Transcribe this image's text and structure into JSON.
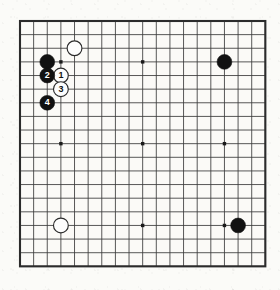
{
  "diagram": {
    "kind": "go-board-diagram",
    "board_size": 19,
    "title": "",
    "caption": "",
    "geometry": {
      "origin_x": 20,
      "origin_y": 21,
      "cell": 13.63,
      "stone_radius": 7.4,
      "line_color": "#3a3a3a",
      "edge_line_color": "#2b2b2b",
      "board_color": "#fbfaf7"
    },
    "colors": {
      "black_stone": "#111111",
      "white_stone": "#fdfdfd",
      "white_stone_outline": "#2b2b2b",
      "black_label_text": "#ffffff",
      "white_label_text": "#111111",
      "grid": "#3a3a3a",
      "hoshi": "#1a1a1a"
    },
    "star_points": [
      {
        "col": 3,
        "row": 3
      },
      {
        "col": 9,
        "row": 3
      },
      {
        "col": 15,
        "row": 3
      },
      {
        "col": 3,
        "row": 9
      },
      {
        "col": 9,
        "row": 9
      },
      {
        "col": 15,
        "row": 9
      },
      {
        "col": 3,
        "row": 15
      },
      {
        "col": 9,
        "row": 15
      },
      {
        "col": 15,
        "row": 15
      }
    ],
    "stones": [
      {
        "id": "black-upper-left-corner",
        "color": "black",
        "col": 2,
        "row": 3,
        "label": ""
      },
      {
        "id": "white-upper-approach",
        "color": "white",
        "col": 4,
        "row": 2,
        "label": ""
      },
      {
        "id": "black-upper-right-hoshi",
        "color": "black",
        "col": 15,
        "row": 3,
        "label": ""
      },
      {
        "id": "white-lower-left",
        "color": "white",
        "col": 3,
        "row": 15,
        "label": ""
      },
      {
        "id": "black-lower-right",
        "color": "black",
        "col": 16,
        "row": 15,
        "label": ""
      },
      {
        "id": "move-1-white",
        "color": "white",
        "col": 3,
        "row": 4,
        "label": "1"
      },
      {
        "id": "move-2-black",
        "color": "black",
        "col": 2,
        "row": 4,
        "label": "2"
      },
      {
        "id": "move-3-white",
        "color": "white",
        "col": 3,
        "row": 5,
        "label": "3"
      },
      {
        "id": "move-4-black",
        "color": "black",
        "col": 2,
        "row": 6,
        "label": "4"
      }
    ],
    "move_sequence": [
      {
        "number": "1",
        "color": "white"
      },
      {
        "number": "2",
        "color": "black"
      },
      {
        "number": "3",
        "color": "white"
      },
      {
        "number": "4",
        "color": "black"
      }
    ]
  }
}
